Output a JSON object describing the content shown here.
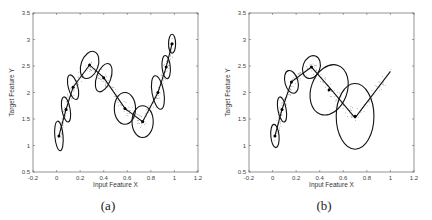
{
  "figure": {
    "captions": [
      "(a)",
      "(b)"
    ]
  },
  "chart_data": [
    {
      "type": "scatter",
      "title": "",
      "caption": "(a)",
      "xlabel": "Input Feature X",
      "ylabel": "Target Feature Y",
      "xlim": [
        -0.2,
        1.2
      ],
      "ylim": [
        0.5,
        3.5
      ],
      "xticks": [
        "-0.2",
        "0",
        "0.2",
        "0.4",
        "0.6",
        "0.8",
        "1",
        "1.2"
      ],
      "yticks": [
        "0.5",
        "1",
        "1.5",
        "2",
        "2.5",
        "3",
        "3.5"
      ],
      "grid": false,
      "legend": null,
      "provenance": {
        "displayed_values": [
          "xlim",
          "ylim",
          "xticks",
          "yticks",
          "xlabel",
          "ylabel",
          "caption"
        ],
        "estimated_values": [
          "centers",
          "ellipses",
          "scatter_description"
        ],
        "note": "Centers and ellipse geometry are visual estimates read off the figure (approx. +/-0.02 in X, +/-0.05 in Y). The figure prints no per-point data labels."
      },
      "scatter_description": "Dense noisy samples along a sinusoid-like curve from about (0, 1.1) up to (0.3, 2.6), down to (0.7, 1.45), up to (1.0, 3.0)",
      "centers": {
        "x": [
          0.02,
          0.08,
          0.14,
          0.28,
          0.4,
          0.58,
          0.73,
          0.86,
          0.93,
          0.98
        ],
        "y": [
          1.18,
          1.68,
          2.1,
          2.52,
          2.28,
          1.7,
          1.45,
          2.0,
          2.48,
          2.92
        ]
      },
      "ellipses": [
        {
          "cx": 0.02,
          "cy": 1.18,
          "rx": 0.035,
          "ry": 0.28,
          "angle": 5
        },
        {
          "cx": 0.08,
          "cy": 1.68,
          "rx": 0.035,
          "ry": 0.24,
          "angle": 10
        },
        {
          "cx": 0.14,
          "cy": 2.1,
          "rx": 0.04,
          "ry": 0.24,
          "angle": 15
        },
        {
          "cx": 0.28,
          "cy": 2.52,
          "rx": 0.12,
          "ry": 0.16,
          "angle": 70
        },
        {
          "cx": 0.4,
          "cy": 2.28,
          "rx": 0.06,
          "ry": 0.28,
          "angle": -20
        },
        {
          "cx": 0.58,
          "cy": 1.7,
          "rx": 0.09,
          "ry": 0.3,
          "angle": 0
        },
        {
          "cx": 0.73,
          "cy": 1.45,
          "rx": 0.09,
          "ry": 0.3,
          "angle": 0
        },
        {
          "cx": 0.86,
          "cy": 2.0,
          "rx": 0.05,
          "ry": 0.32,
          "angle": 10
        },
        {
          "cx": 0.93,
          "cy": 2.48,
          "rx": 0.035,
          "ry": 0.22,
          "angle": 5
        },
        {
          "cx": 0.98,
          "cy": 2.92,
          "rx": 0.03,
          "ry": 0.18,
          "angle": 0
        }
      ]
    },
    {
      "type": "scatter",
      "title": "",
      "caption": "(b)",
      "xlabel": "Input Feature X",
      "ylabel": "Target Feature Y",
      "xlim": [
        -0.2,
        1.2
      ],
      "ylim": [
        0.5,
        3.5
      ],
      "xticks": [
        "-0.2",
        "0",
        "0.2",
        "0.4",
        "0.6",
        "0.8",
        "1",
        "1.2"
      ],
      "yticks": [
        "0.5",
        "1",
        "1.5",
        "2",
        "2.5",
        "3",
        "3.5"
      ],
      "grid": false,
      "legend": null,
      "provenance": {
        "displayed_values": [
          "xlim",
          "ylim",
          "xticks",
          "yticks",
          "xlabel",
          "ylabel",
          "caption"
        ],
        "estimated_values": [
          "centers",
          "ellipses",
          "scatter_description"
        ],
        "note": "Centers and ellipse geometry are visual estimates read off the figure (approx. +/-0.02 in X, +/-0.05 in Y). The figure prints no per-point data labels."
      },
      "scatter_description": "Noisy samples along the same curve; right portion sparsely sampled, a line continues from (0.7, 1.55) up to (1.0, 2.4)",
      "centers": {
        "x": [
          0.02,
          0.08,
          0.16,
          0.33,
          0.48,
          0.7,
          1.0
        ],
        "y": [
          1.18,
          1.68,
          2.2,
          2.48,
          2.1,
          1.52,
          2.4
        ]
      },
      "ellipses": [
        {
          "cx": 0.02,
          "cy": 1.18,
          "rx": 0.035,
          "ry": 0.22,
          "angle": 5
        },
        {
          "cx": 0.08,
          "cy": 1.68,
          "rx": 0.035,
          "ry": 0.24,
          "angle": 10
        },
        {
          "cx": 0.16,
          "cy": 2.2,
          "rx": 0.055,
          "ry": 0.22,
          "angle": 15
        },
        {
          "cx": 0.33,
          "cy": 2.48,
          "rx": 0.1,
          "ry": 0.16,
          "angle": 70
        },
        {
          "cx": 0.48,
          "cy": 2.05,
          "rx": 0.22,
          "ry": 0.34,
          "angle": 70
        },
        {
          "cx": 0.7,
          "cy": 1.55,
          "rx": 0.16,
          "ry": 0.62,
          "angle": 0
        }
      ]
    }
  ]
}
